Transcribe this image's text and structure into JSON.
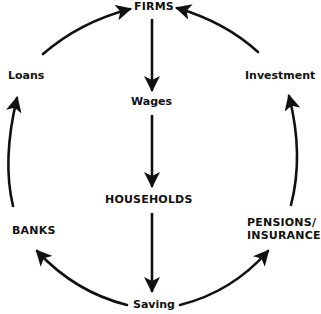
{
  "diagram": {
    "type": "circular-flow",
    "nodes": {
      "firms": "FIRMS",
      "households": "HOUSEHOLDS",
      "banks": "BANKS",
      "pensions_insurance": "PENSIONS/\nINSURANCE",
      "pensions_line1": "PENSIONS/",
      "pensions_line2": "INSURANCE"
    },
    "flows": {
      "wages": "Wages",
      "saving": "Saving",
      "loans": "Loans",
      "investment": "Investment"
    },
    "edges": [
      {
        "from": "FIRMS",
        "to": "HOUSEHOLDS",
        "via": "Wages"
      },
      {
        "from": "HOUSEHOLDS",
        "to": "Saving"
      },
      {
        "from": "Saving",
        "to": "BANKS"
      },
      {
        "from": "Saving",
        "to": "PENSIONS/INSURANCE"
      },
      {
        "from": "BANKS",
        "to": "FIRMS",
        "via": "Loans"
      },
      {
        "from": "PENSIONS/INSURANCE",
        "to": "FIRMS",
        "via": "Investment"
      }
    ],
    "colors": {
      "line": "#111111",
      "background": "#ffffff"
    }
  }
}
